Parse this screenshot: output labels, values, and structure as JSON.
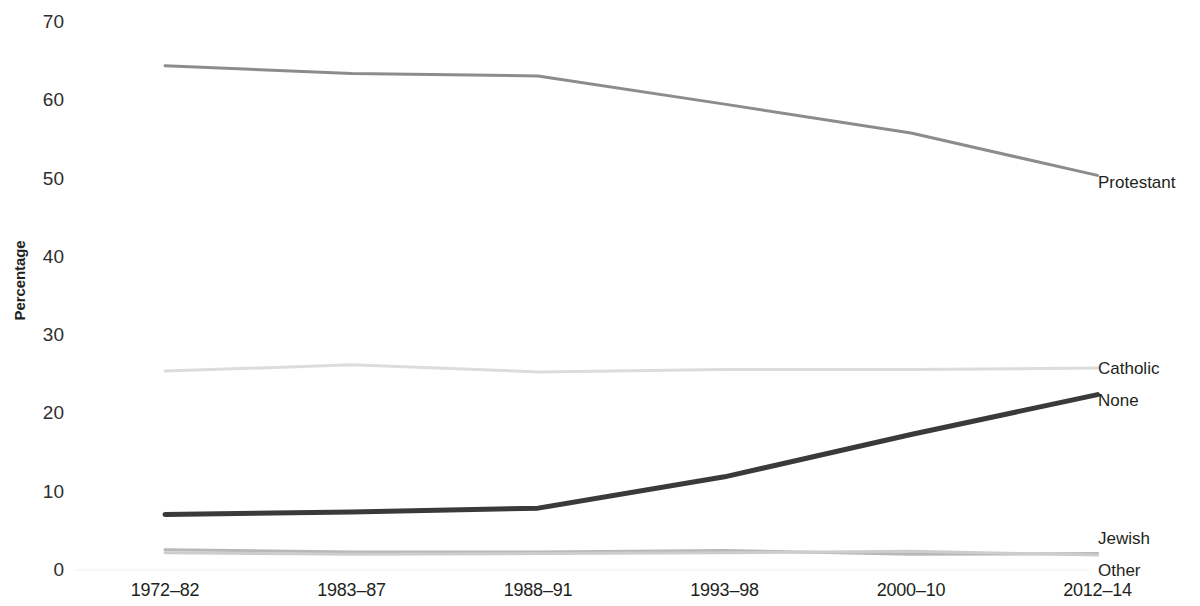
{
  "chart_data": {
    "type": "line",
    "title": "",
    "subtitle": "",
    "xlabel": "",
    "ylabel": "Percentage",
    "categories": [
      "1972–82",
      "1983–87",
      "1988–91",
      "1993–98",
      "2000–10",
      "2012–14"
    ],
    "ylim": [
      0,
      70
    ],
    "yticks": [
      0,
      10,
      20,
      30,
      40,
      50,
      60,
      70
    ],
    "ytick_labels": [
      "0",
      "10",
      "20",
      "30",
      "40",
      "50",
      "60",
      "70"
    ],
    "grid": false,
    "legend": "right-inline",
    "series": [
      {
        "name": "Protestant",
        "color": "#8c8c8c",
        "width": 3,
        "values": [
          64.4,
          63.4,
          63.1,
          59.5,
          55.8,
          50.4
        ]
      },
      {
        "name": "Catholic",
        "color": "#dcdcdc",
        "width": 3,
        "values": [
          25.4,
          26.2,
          25.3,
          25.6,
          25.6,
          25.8
        ]
      },
      {
        "name": "None",
        "color": "#3a3a3a",
        "width": 5,
        "values": [
          7.1,
          7.4,
          7.9,
          11.9,
          17.3,
          22.4
        ]
      },
      {
        "name": "Jewish",
        "color": "#b8b8b8",
        "width": 3,
        "values": [
          2.6,
          2.3,
          2.3,
          2.5,
          2.0,
          2.1
        ]
      },
      {
        "name": "Other",
        "color": "#cdcdcd",
        "width": 3,
        "values": [
          2.2,
          2.0,
          2.1,
          2.2,
          2.4,
          1.9
        ]
      }
    ]
  },
  "axis": {
    "y_title": "Percentage"
  },
  "series_labels": [
    {
      "text": "Protestant",
      "top": 174
    },
    {
      "text": "Catholic",
      "top": 360
    },
    {
      "text": "None",
      "top": 392
    },
    {
      "text": "Jewish",
      "top": 530
    },
    {
      "text": "Other",
      "top": 562
    }
  ]
}
